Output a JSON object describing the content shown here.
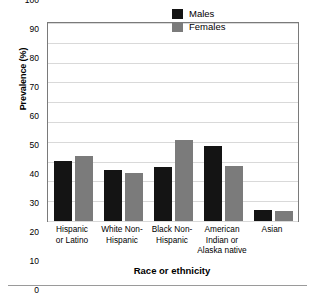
{
  "chart_data": {
    "type": "bar",
    "title": "",
    "xlabel": "Race or ethnicity",
    "ylabel": "Prevalence (%)",
    "ylim": [
      0,
      100
    ],
    "ytick_step": 10,
    "yticks": [
      100,
      90,
      80,
      70,
      60,
      50,
      40,
      30,
      20,
      10,
      0
    ],
    "grid": true,
    "legend_position": "top-right",
    "categories": [
      "Hispanic\nor Latino",
      "White Non-\nHispanic",
      "Black Non-\nHispanic",
      "American\nIndian or\nAlaska native",
      "Asian"
    ],
    "series": [
      {
        "name": "Males",
        "color": "#141414",
        "values": [
          30.5,
          26,
          27.5,
          38,
          5.5
        ]
      },
      {
        "name": "Females",
        "color": "#7b7b7b",
        "values": [
          33,
          24.5,
          41,
          28,
          5
        ]
      }
    ]
  }
}
